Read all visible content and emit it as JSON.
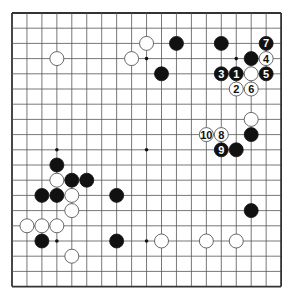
{
  "board": {
    "size": 19,
    "origin_x": 12,
    "origin_y": 13,
    "spacing_x": 14.95,
    "spacing_y": 15.2,
    "stone_radius": 7,
    "line_color": "#555555",
    "edge_color": "#333333",
    "black_color": "#111111",
    "white_fill": "#ffffff",
    "white_stroke": "#444444"
  },
  "star_points": [
    {
      "c": 3,
      "r": 3
    },
    {
      "c": 9,
      "r": 3
    },
    {
      "c": 15,
      "r": 3
    },
    {
      "c": 3,
      "r": 9
    },
    {
      "c": 9,
      "r": 9
    },
    {
      "c": 15,
      "r": 9
    },
    {
      "c": 3,
      "r": 15
    },
    {
      "c": 9,
      "r": 15
    },
    {
      "c": 15,
      "r": 15
    }
  ],
  "stones": [
    {
      "color": "white",
      "c": 3,
      "r": 3,
      "label": ""
    },
    {
      "color": "white",
      "c": 8,
      "r": 3,
      "label": ""
    },
    {
      "color": "white",
      "c": 9,
      "r": 2,
      "label": ""
    },
    {
      "color": "black",
      "c": 11,
      "r": 2,
      "label": ""
    },
    {
      "color": "black",
      "c": 14,
      "r": 2,
      "label": ""
    },
    {
      "color": "black",
      "c": 17,
      "r": 2,
      "label": "7"
    },
    {
      "color": "black",
      "c": 10,
      "r": 4,
      "label": ""
    },
    {
      "color": "black",
      "c": 16,
      "r": 3,
      "label": ""
    },
    {
      "color": "white",
      "c": 17,
      "r": 3,
      "label": "4"
    },
    {
      "color": "black",
      "c": 14,
      "r": 4,
      "label": "3"
    },
    {
      "color": "black",
      "c": 15,
      "r": 4,
      "label": "1"
    },
    {
      "color": "white",
      "c": 16,
      "r": 4,
      "label": ""
    },
    {
      "color": "black",
      "c": 17,
      "r": 4,
      "label": "5"
    },
    {
      "color": "white",
      "c": 15,
      "r": 5,
      "label": "2"
    },
    {
      "color": "white",
      "c": 16,
      "r": 5,
      "label": "6"
    },
    {
      "color": "white",
      "c": 16,
      "r": 7,
      "label": ""
    },
    {
      "color": "white",
      "c": 13,
      "r": 8,
      "label": "10"
    },
    {
      "color": "white",
      "c": 14,
      "r": 8,
      "label": "8"
    },
    {
      "color": "black",
      "c": 16,
      "r": 8,
      "label": ""
    },
    {
      "color": "black",
      "c": 14,
      "r": 9,
      "label": "9"
    },
    {
      "color": "black",
      "c": 15,
      "r": 9,
      "label": ""
    },
    {
      "color": "black",
      "c": 3,
      "r": 10,
      "label": ""
    },
    {
      "color": "white",
      "c": 3,
      "r": 11,
      "label": ""
    },
    {
      "color": "black",
      "c": 4,
      "r": 11,
      "label": ""
    },
    {
      "color": "black",
      "c": 5,
      "r": 11,
      "label": ""
    },
    {
      "color": "black",
      "c": 2,
      "r": 12,
      "label": ""
    },
    {
      "color": "black",
      "c": 3,
      "r": 12,
      "label": ""
    },
    {
      "color": "white",
      "c": 4,
      "r": 12,
      "label": ""
    },
    {
      "color": "black",
      "c": 7,
      "r": 12,
      "label": ""
    },
    {
      "color": "white",
      "c": 4,
      "r": 13,
      "label": ""
    },
    {
      "color": "black",
      "c": 16,
      "r": 13,
      "label": ""
    },
    {
      "color": "white",
      "c": 1,
      "r": 14,
      "label": ""
    },
    {
      "color": "white",
      "c": 2,
      "r": 14,
      "label": ""
    },
    {
      "color": "white",
      "c": 3,
      "r": 14,
      "label": ""
    },
    {
      "color": "black",
      "c": 2,
      "r": 15,
      "label": ""
    },
    {
      "color": "black",
      "c": 7,
      "r": 15,
      "label": ""
    },
    {
      "color": "white",
      "c": 10,
      "r": 15,
      "label": ""
    },
    {
      "color": "white",
      "c": 13,
      "r": 15,
      "label": ""
    },
    {
      "color": "white",
      "c": 15,
      "r": 15,
      "label": ""
    },
    {
      "color": "white",
      "c": 4,
      "r": 16,
      "label": ""
    }
  ]
}
